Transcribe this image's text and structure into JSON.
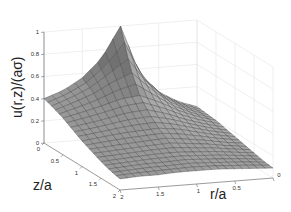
{
  "chart_data": {
    "type": "surface",
    "title": "",
    "xlabel": "r/a",
    "ylabel": "z/a",
    "zlabel": "u(r,z)/(aσ)",
    "x_axis": {
      "name": "r/a",
      "range": [
        0,
        2
      ],
      "ticks": [
        0,
        0.5,
        1,
        1.5,
        2
      ],
      "tick_labels": [
        "0",
        "0.5",
        "1",
        "1.5",
        "2"
      ]
    },
    "y_axis": {
      "name": "z/a",
      "range": [
        0,
        2
      ],
      "ticks": [
        0,
        0.5,
        1,
        1.5,
        2
      ],
      "tick_labels": [
        "0",
        "0.5",
        "1",
        "1.5",
        "2"
      ]
    },
    "z_axis": {
      "name": "u(r,z)/(aσ)",
      "range": [
        0,
        1
      ],
      "ticks": [
        0,
        0.2,
        0.4,
        0.6,
        0.8,
        1
      ],
      "tick_labels": [
        "0",
        "0.2",
        "0.4",
        "0.6",
        "0.8",
        "1"
      ]
    },
    "grid": true,
    "colormap": "gray",
    "r_values": [
      0,
      0.25,
      0.5,
      0.75,
      1,
      1.25,
      1.5,
      1.75,
      2
    ],
    "z_values": [
      0,
      0.25,
      0.5,
      0.75,
      1,
      1.25,
      1.5,
      1.75,
      2
    ],
    "u_values": [
      [
        0.22,
        0.28,
        0.38,
        0.56,
        1.0,
        0.72,
        0.56,
        0.46,
        0.4
      ],
      [
        0.21,
        0.27,
        0.36,
        0.5,
        0.68,
        0.6,
        0.5,
        0.43,
        0.37
      ],
      [
        0.2,
        0.25,
        0.32,
        0.41,
        0.48,
        0.46,
        0.41,
        0.37,
        0.33
      ],
      [
        0.18,
        0.22,
        0.27,
        0.33,
        0.37,
        0.36,
        0.33,
        0.3,
        0.28
      ],
      [
        0.16,
        0.19,
        0.23,
        0.27,
        0.29,
        0.28,
        0.27,
        0.25,
        0.23
      ],
      [
        0.14,
        0.16,
        0.19,
        0.21,
        0.23,
        0.22,
        0.21,
        0.2,
        0.19
      ],
      [
        0.12,
        0.14,
        0.16,
        0.17,
        0.18,
        0.18,
        0.17,
        0.16,
        0.15
      ],
      [
        0.1,
        0.12,
        0.13,
        0.14,
        0.15,
        0.14,
        0.14,
        0.13,
        0.12
      ],
      [
        0.09,
        0.1,
        0.11,
        0.12,
        0.12,
        0.12,
        0.11,
        0.11,
        0.1
      ]
    ],
    "peak": {
      "r": 1,
      "z": 0,
      "u": 1
    }
  }
}
